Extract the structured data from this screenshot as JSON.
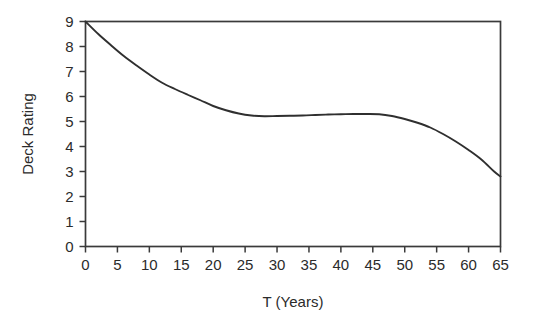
{
  "chart_data": {
    "type": "line",
    "title": "",
    "xlabel": "T (Years)",
    "ylabel": "Deck Rating",
    "xlim": [
      0,
      65
    ],
    "ylim": [
      0,
      9
    ],
    "grid": false,
    "legend": false,
    "xticks": [
      0,
      5,
      10,
      15,
      20,
      25,
      30,
      35,
      40,
      45,
      50,
      55,
      60,
      65
    ],
    "xtick_labels": [
      "0",
      "5",
      "10",
      "15",
      "20",
      "25",
      "30",
      "35",
      "40",
      "45",
      "50",
      "55",
      "60",
      "65"
    ],
    "yticks": [
      0,
      1,
      2,
      3,
      4,
      5,
      6,
      7,
      8,
      9
    ],
    "ytick_labels": [
      "0",
      "1",
      "2",
      "3",
      "4",
      "5",
      "6",
      "7",
      "8",
      "9"
    ],
    "line_color": "#2f2f2f",
    "frame_color": "#3a3a3a",
    "series": [
      {
        "name": "Deck Rating",
        "x": [
          0,
          2,
          4,
          6,
          8,
          10,
          12,
          14,
          16,
          18,
          20,
          22,
          24,
          26,
          28,
          30,
          32,
          34,
          36,
          38,
          40,
          42,
          44,
          46,
          48,
          50,
          52,
          54,
          56,
          58,
          60,
          62,
          64,
          65
        ],
        "values": [
          9.0,
          8.5,
          8.05,
          7.62,
          7.24,
          6.88,
          6.55,
          6.3,
          6.07,
          5.85,
          5.62,
          5.45,
          5.32,
          5.24,
          5.21,
          5.22,
          5.23,
          5.24,
          5.26,
          5.28,
          5.29,
          5.3,
          5.3,
          5.29,
          5.22,
          5.1,
          4.95,
          4.76,
          4.5,
          4.2,
          3.86,
          3.48,
          3.0,
          2.8
        ]
      }
    ]
  },
  "axes": {
    "y_axis_title": "Deck Rating",
    "x_axis_title": "T (Years)"
  }
}
